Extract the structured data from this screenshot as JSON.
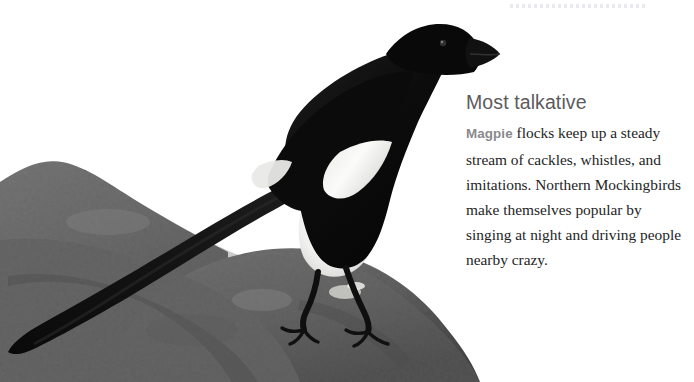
{
  "page": {
    "background_color": "#ffffff",
    "divider": {
      "style": "dotted",
      "color": "#e9e9ee"
    }
  },
  "photo": {
    "alt_description": "Black-and-white photograph of a Black-billed Magpie perched on a large gray boulder, its long tail angled down across the rock",
    "subject": "Magpie",
    "palette": {
      "bird_black": "#0d0d0d",
      "bird_white": "#f4f4f2",
      "rock_gray": "#6e6e6e",
      "rock_shadow": "#4a4a4a",
      "sky_white": "#ffffff"
    }
  },
  "text_panel": {
    "heading": "Most talkative",
    "species": "Magpie",
    "body": " flocks keep up a steady stream of cackles, whistles, and imitations. Northern Mockingbirds make themselves popular by singing at night and driving people nearby crazy.",
    "heading_color": "#5b5b5d",
    "species_color": "#8a8a8c",
    "body_color": "#242424"
  }
}
